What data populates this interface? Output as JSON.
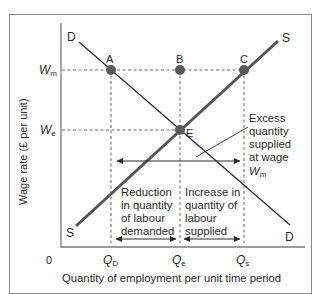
{
  "diagram": {
    "y_axis_label": "Wage rate (£ per unit)",
    "x_axis_label": "Quantity of employment per unit time period",
    "origin_label": "0",
    "y_ticks": [
      {
        "main": "W",
        "sub": "m"
      },
      {
        "main": "W",
        "sub": "e"
      }
    ],
    "x_ticks": [
      {
        "main": "Q",
        "sub": "D"
      },
      {
        "main": "Q",
        "sub": "e"
      },
      {
        "main": "Q",
        "sub": "s"
      }
    ],
    "curves": {
      "demand_top_label": "D",
      "demand_bottom_label": "D",
      "supply_top_label": "S",
      "supply_bottom_label": "S"
    },
    "points": {
      "A": "A",
      "B": "B",
      "C": "C",
      "E": "E"
    },
    "annotations": {
      "excess": [
        "Excess",
        "quantity",
        "supplied",
        "at wage"
      ],
      "excess_wage": {
        "main": "W",
        "sub": "m"
      },
      "reduction": [
        "Reduction",
        "in quantity",
        "of labour",
        "demanded"
      ],
      "increase": [
        "Increase in",
        "quantity of",
        "labour",
        "supplied"
      ]
    },
    "colors": {
      "supply_line": "#555555",
      "demand_line": "#2b2b2b",
      "points": "#5a5a5a",
      "axis": "#7a7a7a",
      "dashes": "#6a6a6a",
      "text": "#2a2a2a"
    }
  }
}
